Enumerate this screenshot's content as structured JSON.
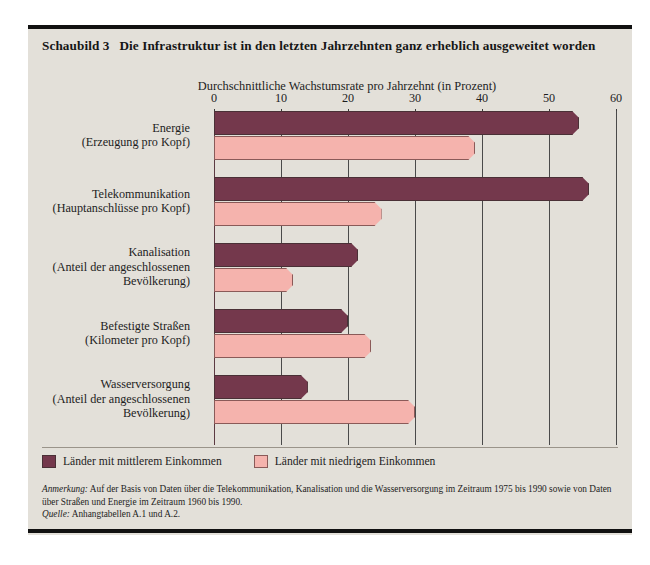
{
  "figure": {
    "number_label": "Schaubild 3",
    "title": "Die Infrastruktur ist in den letzten Jahrzehnten ganz erheblich ausgeweitet worden"
  },
  "legend": {
    "items": [
      {
        "label": "Länder mit mittlerem Einkommen",
        "color": "#74384c",
        "key": "mid"
      },
      {
        "label": "Länder mit niedrigem Einkommen",
        "color": "#f5b3ad",
        "key": "low"
      }
    ]
  },
  "notes": {
    "note_lead": "Anmerkung:",
    "note_text": " Auf der Basis von Daten über die Telekommunikation, Kanalisation und die Wasserversorgung im Zeitraum 1975 bis 1990 sowie von Daten über Straßen und Energie im Zeitraum 1960 bis 1990.",
    "source_lead": "Quelle:",
    "source_text": " Anhangtabellen A.1 und A.2."
  },
  "chart_data": {
    "type": "bar",
    "orientation": "horizontal",
    "title": "Die Infrastruktur ist in den letzten Jahrzehnten ganz erheblich ausgeweitet worden",
    "subtitle": "Durchschnittliche Wachstumsrate pro Jahrzehnt (in Prozent)",
    "xlabel": "Durchschnittliche Wachstumsrate pro Jahrzehnt (in Prozent)",
    "ylabel": "",
    "xlim": [
      0,
      60
    ],
    "xticks": [
      0,
      10,
      20,
      30,
      40,
      50,
      60
    ],
    "xtick_labels": [
      "0",
      "10",
      "20",
      "30",
      "40",
      "50",
      "60"
    ],
    "grid": "vertical",
    "legend_position": "below-plot-left",
    "categories": [
      "Energie\n(Erzeugung pro Kopf)",
      "Telekommunikation\n(Hauptanschlüsse pro Kopf)",
      "Kanalisation\n(Anteil der angeschlossenen Bevölkerung)",
      "Befestigte Straßen\n(Kilometer pro Kopf)",
      "Wasserversorgung\n(Anteil der angeschlossenen Bevölkerung)"
    ],
    "category_lines": [
      [
        "Energie",
        "(Erzeugung pro Kopf)"
      ],
      [
        "Telekommunikation",
        "(Hauptanschlüsse pro Kopf)"
      ],
      [
        "Kanalisation",
        "(Anteil der angeschlossenen",
        "Bevölkerung)"
      ],
      [
        "Befestigte Straßen",
        "(Kilometer pro Kopf)"
      ],
      [
        "Wasserversorgung",
        "(Anteil der angeschlossenen",
        "Bevölkerung)"
      ]
    ],
    "series": [
      {
        "name": "Länder mit mittlerem Einkommen",
        "color": "#74384c",
        "values": [
          54.5,
          56.0,
          21.5,
          20.0,
          14.0
        ]
      },
      {
        "name": "Länder mit niedrigem Einkommen",
        "color": "#f5b3ad",
        "values": [
          39.0,
          25.0,
          11.8,
          23.5,
          30.0
        ]
      }
    ]
  }
}
